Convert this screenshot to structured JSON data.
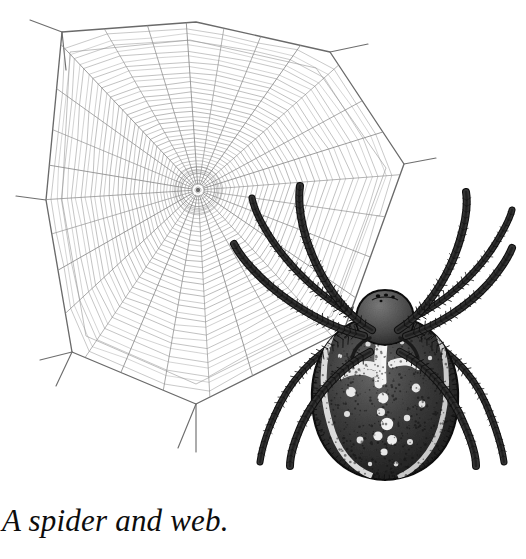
{
  "figure": {
    "caption": "A spider and web.",
    "alt_subject": "A spider and web.",
    "background_color": "#ffffff"
  },
  "artwork": {
    "medium": "pen-and-ink line engraving",
    "ink_color": "#1a1a1a",
    "web_line_color": "#8a8a8a",
    "web_frame_color": "#6e6e6e",
    "highlight_color": "#f2f2f2"
  },
  "web": {
    "name": "orb-web",
    "hub_center_x": 198,
    "hub_center_y": 190,
    "radial_count": 28,
    "spiral_turn_count": 34,
    "free_zone_radius": 30,
    "outer_radius": 175,
    "frame_anchor_points": [
      [
        62,
        32
      ],
      [
        196,
        22
      ],
      [
        330,
        52
      ],
      [
        404,
        164
      ],
      [
        344,
        330
      ],
      [
        196,
        404
      ],
      [
        72,
        352
      ],
      [
        46,
        200
      ]
    ],
    "anchor_lines": 8
  },
  "spider": {
    "name": "garden-orb-weaver",
    "body_center_x": 385,
    "body_center_y": 380,
    "abdomen_pattern": "white-cross-and-spots",
    "leg_count": 8,
    "leg_feature": "bristled-spined",
    "abdomen_spot_count": 24
  },
  "colors": {
    "ink": "#1a1a1a",
    "web_thread": "#8e8e8e",
    "web_frame": "#6a6a6a",
    "abdomen_dark": "#2b2b2b",
    "abdomen_mid": "#555555",
    "spot_white": "#f4f4f4",
    "paper": "#ffffff",
    "caption_text": "#0d0d0d"
  }
}
